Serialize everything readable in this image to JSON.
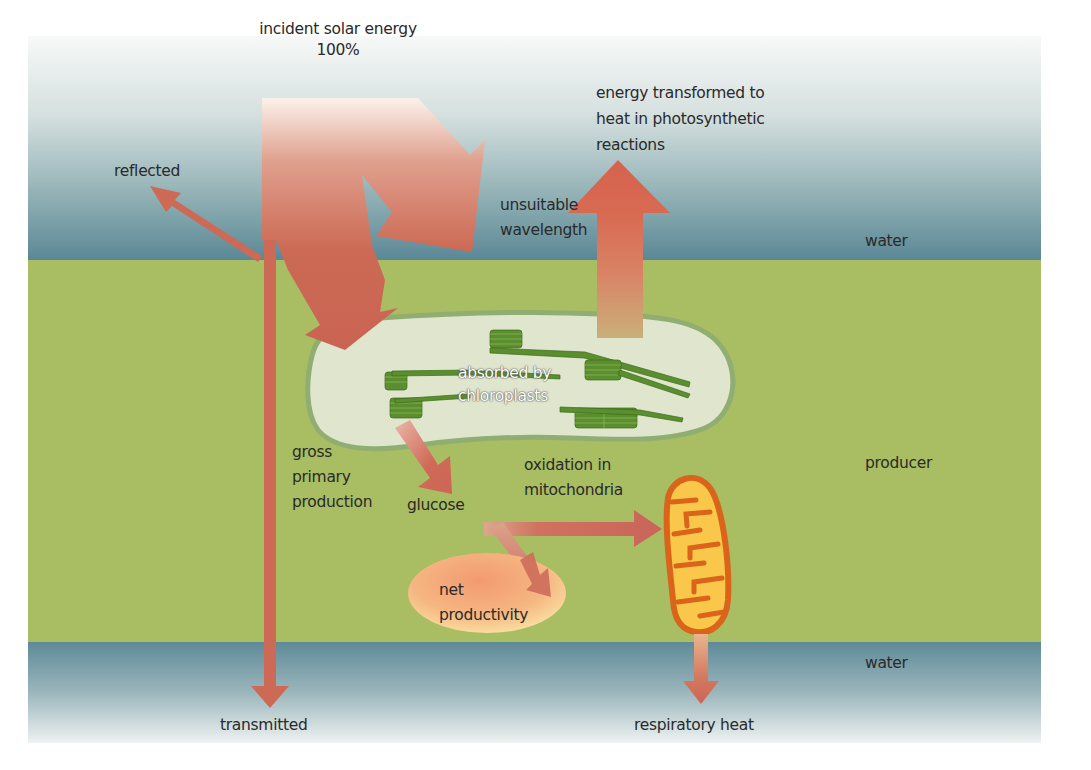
{
  "diagram": {
    "type": "energy-flow",
    "colors": {
      "water_top": "#eef2f1",
      "water_deep": "#5d8b98",
      "producer": "#a9bd62",
      "arrow": "#cc6a55",
      "arrow_light": "#f3e3d6",
      "chloroplast_fill": "#e4e9d4",
      "chloroplast_outline": "#8fae72",
      "thylakoid": "#5a8e2e",
      "mitochondrion_outer": "#d9641a",
      "mitochondrion_inner": "#f9c84a",
      "net_productivity": "#f6b680"
    },
    "layers": [
      {
        "label": "water"
      },
      {
        "label": "producer"
      },
      {
        "label": "water"
      }
    ],
    "labels": {
      "incident_line1": "incident solar energy",
      "incident_line2": "100%",
      "reflected": "reflected",
      "unsuitable_line1": "unsuitable",
      "unsuitable_line2": "wavelength",
      "heat_line1": "energy transformed to",
      "heat_line2": "heat in photosynthetic",
      "heat_line3": "reactions",
      "water_top": "water",
      "absorbed_line1": "absorbed by",
      "absorbed_line2": "chloroplasts",
      "gross_line1": "gross",
      "gross_line2": "primary",
      "gross_line3": "production",
      "glucose": "glucose",
      "oxidation_line1": "oxidation in",
      "oxidation_line2": "mitochondria",
      "producer": "producer",
      "net_line1": "net",
      "net_line2": "productivity",
      "water_bottom": "water",
      "transmitted": "transmitted",
      "respiratory_heat": "respiratory heat"
    }
  }
}
